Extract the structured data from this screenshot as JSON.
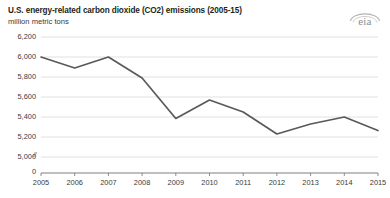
{
  "header": {
    "title": "U.S. energy-related carbon dioxide (CO2) emissions (2005-15)",
    "subtitle": "million metric tons",
    "logo_text": "eia",
    "logo_name": "eia-logo"
  },
  "chart_data": {
    "type": "line",
    "title": "U.S. energy-related carbon dioxide (CO2) emissions (2005-15)",
    "subtitle": "million metric tons",
    "xlabel": "",
    "ylabel": "million metric tons",
    "categories": [
      "2005",
      "2006",
      "2007",
      "2008",
      "2009",
      "2010",
      "2011",
      "2012",
      "2013",
      "2014",
      "2015"
    ],
    "x": [
      2005,
      2006,
      2007,
      2008,
      2009,
      2010,
      2011,
      2012,
      2013,
      2014,
      2015
    ],
    "values": [
      6000,
      5890,
      6000,
      5790,
      5385,
      5570,
      5450,
      5230,
      5330,
      5400,
      5265
    ],
    "series": [
      {
        "name": "U.S. energy-related CO2 emissions",
        "values": [
          6000,
          5890,
          6000,
          5790,
          5385,
          5570,
          5450,
          5230,
          5330,
          5400,
          5265
        ],
        "color": "#595959"
      }
    ],
    "ylim": [
      5000,
      6200
    ],
    "yticks": [
      5000,
      5200,
      5400,
      5600,
      5800,
      6000,
      6200
    ],
    "ytick_labels": [
      "5,000",
      "5,200",
      "5,400",
      "5,600",
      "5,800",
      "6,000",
      "6,200"
    ],
    "xtick_labels": [
      "2005",
      "2006",
      "2007",
      "2008",
      "2009",
      "2010",
      "2011",
      "2012",
      "2013",
      "2014",
      "2015"
    ],
    "axis_break_label": "//",
    "zero_label": "0",
    "grid": true,
    "grid_color": "#d9d9d9",
    "axis_color": "#808080",
    "legend": "none",
    "line_color": "#595959"
  }
}
